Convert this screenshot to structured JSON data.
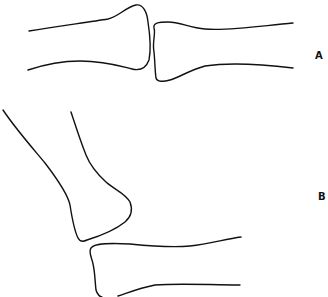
{
  "figure": {
    "panels": [
      {
        "label": "A",
        "description": "Two bones aligned end-to-end, joint in extension"
      },
      {
        "label": "B",
        "description": "Joint in flexion, upper bone angled above lower bone"
      }
    ],
    "colors": {
      "stroke": "#111111",
      "background": "#ffffff"
    }
  }
}
